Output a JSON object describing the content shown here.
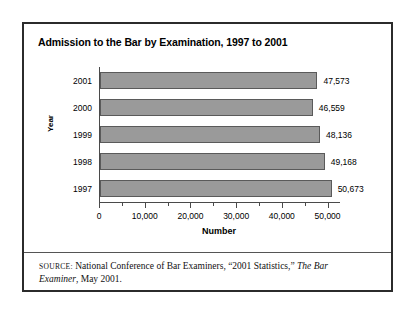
{
  "figure": {
    "title": "Admission to the Bar by Examination, 1997 to 2001",
    "source_label": "SOURCE:",
    "source_text_1": " National Conference of Bar Examiners, “2001 Statistics,” ",
    "source_italic_1": "The Bar Examiner",
    "source_text_2": ", May 2001."
  },
  "chart_data": {
    "type": "bar",
    "orientation": "horizontal",
    "title": "Admission to the Bar by Examination, 1997 to 2001",
    "xlabel": "Number",
    "ylabel": "Year",
    "categories": [
      "2001",
      "2000",
      "1999",
      "1998",
      "1997"
    ],
    "values": [
      47573,
      46559,
      48136,
      49168,
      50673
    ],
    "value_labels": [
      "47,573",
      "46,559",
      "48,136",
      "49,168",
      "50,673"
    ],
    "xlim": [
      0,
      52500
    ],
    "xticks": [
      0,
      10000,
      20000,
      30000,
      40000,
      50000
    ],
    "xticklabels": [
      "0",
      "10,000",
      "20,000",
      "30,000",
      "40,000",
      "50,000"
    ],
    "minor_tick_interval": 5000,
    "grid": false,
    "legend": null,
    "bar_color": "#9a9a9a",
    "bar_edge_color": "#5a5a5a",
    "axis_color": "#4a4a4a"
  }
}
